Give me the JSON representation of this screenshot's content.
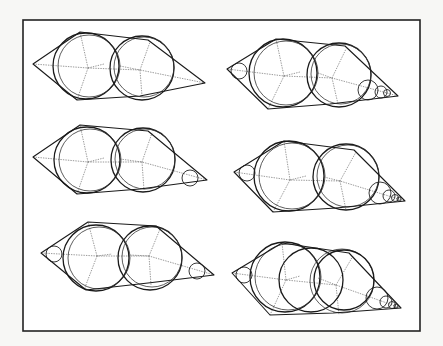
{
  "figure": {
    "frame": {
      "x": 23,
      "y": 20,
      "w": 397,
      "h": 311
    },
    "colors": {
      "stroke": "#1a1a1a",
      "background": "#ffffff",
      "page": "#f7f7f5"
    },
    "panels": [
      {
        "id": "top-left",
        "hull": [
          [
            33,
            64
          ],
          [
            80,
            32
          ],
          [
            148,
            40
          ],
          [
            205,
            83
          ],
          [
            140,
            96
          ],
          [
            77,
            100
          ]
        ],
        "big_circles": [
          [
            86,
            66,
            33
          ],
          [
            89,
            66,
            31
          ],
          [
            142,
            68,
            32
          ],
          [
            144,
            67,
            30
          ]
        ],
        "small_circles": [],
        "skeleton": [
          [
            [
              33,
              64
            ],
            [
              88,
              68
            ],
            [
              140,
              70
            ],
            [
              205,
              83
            ]
          ],
          [
            [
              88,
              68
            ],
            [
              80,
              32
            ]
          ],
          [
            [
              88,
              68
            ],
            [
              77,
              100
            ]
          ],
          [
            [
              140,
              70
            ],
            [
              150,
              42
            ]
          ],
          [
            [
              140,
              70
            ],
            [
              142,
              96
            ]
          ],
          [
            [
              88,
              68
            ],
            [
              104,
              64
            ]
          ],
          [
            [
              120,
              66
            ],
            [
              140,
              70
            ]
          ]
        ]
      },
      {
        "id": "top-right",
        "hull": [
          [
            227,
            69
          ],
          [
            276,
            39
          ],
          [
            345,
            46
          ],
          [
            398,
            96
          ],
          [
            330,
            104
          ],
          [
            268,
            109
          ]
        ],
        "big_circles": [
          [
            283,
            73,
            34
          ],
          [
            286,
            73,
            32
          ],
          [
            339,
            75,
            32
          ],
          [
            341,
            74,
            30
          ]
        ],
        "small_circles": [
          [
            239,
            71,
            8
          ],
          [
            368,
            90,
            10
          ],
          [
            381,
            92,
            6
          ],
          [
            387,
            93,
            3.5
          ]
        ],
        "skeleton": [
          [
            [
              227,
              69
            ],
            [
              284,
              76
            ],
            [
              332,
              78
            ],
            [
              398,
              96
            ]
          ],
          [
            [
              284,
              76
            ],
            [
              276,
              39
            ]
          ],
          [
            [
              284,
              76
            ],
            [
              268,
              109
            ]
          ],
          [
            [
              332,
              78
            ],
            [
              346,
              49
            ]
          ],
          [
            [
              332,
              78
            ],
            [
              338,
              104
            ]
          ],
          [
            [
              284,
              76
            ],
            [
              300,
              72
            ]
          ],
          [
            [
              318,
              73
            ],
            [
              332,
              78
            ]
          ]
        ]
      },
      {
        "id": "middle-left",
        "hull": [
          [
            33,
            157
          ],
          [
            80,
            125
          ],
          [
            148,
            131
          ],
          [
            207,
            180
          ],
          [
            140,
            189
          ],
          [
            77,
            194
          ]
        ],
        "big_circles": [
          [
            87,
            160,
            33
          ],
          [
            90,
            160,
            31
          ],
          [
            143,
            160,
            32
          ],
          [
            145,
            159,
            30
          ]
        ],
        "small_circles": [
          [
            190,
            178,
            8
          ]
        ],
        "skeleton": [
          [
            [
              33,
              157
            ],
            [
              88,
              162
            ],
            [
              142,
              162
            ],
            [
              207,
              180
            ]
          ],
          [
            [
              88,
              162
            ],
            [
              80,
              125
            ]
          ],
          [
            [
              88,
              162
            ],
            [
              77,
              194
            ]
          ],
          [
            [
              142,
              162
            ],
            [
              152,
              133
            ]
          ],
          [
            [
              142,
              162
            ],
            [
              144,
              190
            ]
          ],
          [
            [
              88,
              162
            ],
            [
              104,
              158
            ]
          ],
          [
            [
              120,
              159
            ],
            [
              142,
              162
            ]
          ]
        ]
      },
      {
        "id": "middle-right",
        "hull": [
          [
            234,
            172
          ],
          [
            284,
            141
          ],
          [
            354,
            150
          ],
          [
            405,
            201
          ],
          [
            336,
            208
          ],
          [
            273,
            212
          ]
        ],
        "big_circles": [
          [
            289,
            176,
            35
          ],
          [
            292,
            176,
            33
          ],
          [
            346,
            177,
            33
          ],
          [
            348,
            176,
            31
          ]
        ],
        "small_circles": [
          [
            247,
            173,
            8
          ],
          [
            380,
            193,
            11
          ],
          [
            389,
            196,
            6
          ],
          [
            395,
            198,
            3.5
          ],
          [
            399,
            199,
            2
          ]
        ],
        "skeleton": [
          [
            [
              234,
              172
            ],
            [
              290,
              180
            ],
            [
              340,
              181
            ],
            [
              405,
              201
            ]
          ],
          [
            [
              290,
              180
            ],
            [
              284,
              141
            ]
          ],
          [
            [
              290,
              180
            ],
            [
              273,
              212
            ]
          ],
          [
            [
              340,
              181
            ],
            [
              356,
              152
            ]
          ],
          [
            [
              340,
              181
            ],
            [
              346,
              210
            ]
          ],
          [
            [
              290,
              180
            ],
            [
              306,
              176
            ]
          ],
          [
            [
              324,
              177
            ],
            [
              340,
              181
            ]
          ]
        ]
      },
      {
        "id": "bottom-left",
        "hull": [
          [
            41,
            253
          ],
          [
            88,
            222
          ],
          [
            156,
            226
          ],
          [
            214,
            275
          ],
          [
            148,
            283
          ],
          [
            86,
            290
          ]
        ],
        "big_circles": [
          [
            96,
            258,
            33
          ],
          [
            99,
            258,
            31
          ],
          [
            150,
            258,
            32
          ],
          [
            152,
            257,
            30
          ]
        ],
        "small_circles": [
          [
            54,
            254,
            8
          ],
          [
            197,
            271,
            8
          ]
        ],
        "skeleton": [
          [
            [
              41,
              253
            ],
            [
              97,
              256
            ],
            [
              149,
              256
            ],
            [
              214,
              275
            ]
          ],
          [
            [
              97,
              256
            ],
            [
              88,
              222
            ]
          ],
          [
            [
              97,
              256
            ],
            [
              84,
              290
            ]
          ],
          [
            [
              149,
              256
            ],
            [
              160,
              229
            ]
          ],
          [
            [
              149,
              256
            ],
            [
              151,
              285
            ]
          ],
          [
            [
              97,
              256
            ],
            [
              112,
              254
            ]
          ],
          [
            [
              130,
              255
            ],
            [
              149,
              256
            ]
          ]
        ]
      },
      {
        "id": "bottom-right",
        "hull": [
          [
            232,
            273
          ],
          [
            282,
            243
          ],
          [
            349,
            253
          ],
          [
            401,
            308
          ],
          [
            333,
            313
          ],
          [
            270,
            315
          ]
        ],
        "big_circles": [
          [
            285,
            277,
            35
          ],
          [
            288,
            277,
            33
          ],
          [
            311,
            280,
            32
          ],
          [
            342,
            281,
            32
          ],
          [
            344,
            280,
            30
          ]
        ],
        "small_circles": [
          [
            244,
            275,
            8
          ],
          [
            377,
            298,
            11
          ],
          [
            386,
            302,
            6
          ],
          [
            392,
            305,
            3.5
          ],
          [
            396,
            306,
            2
          ]
        ],
        "skeleton": [
          [
            [
              232,
              273
            ],
            [
              286,
              280
            ],
            [
              336,
              285
            ],
            [
              401,
              308
            ]
          ],
          [
            [
              286,
              280
            ],
            [
              282,
              243
            ]
          ],
          [
            [
              286,
              280
            ],
            [
              270,
              315
            ]
          ],
          [
            [
              336,
              285
            ],
            [
              353,
              256
            ]
          ],
          [
            [
              336,
              285
            ],
            [
              339,
              315
            ]
          ],
          [
            [
              286,
              280
            ],
            [
              300,
              276
            ]
          ],
          [
            [
              318,
              278
            ],
            [
              336,
              285
            ]
          ]
        ]
      }
    ]
  }
}
